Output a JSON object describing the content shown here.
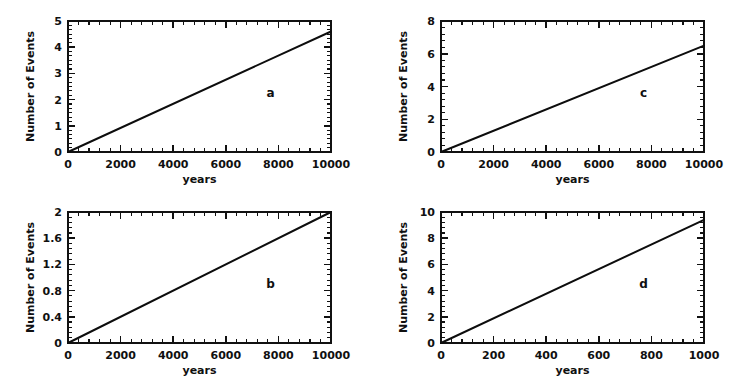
{
  "figure": {
    "background": "#ffffff",
    "ink_color": "#111111",
    "panel_count": 4
  },
  "chart_data": [
    {
      "type": "line",
      "panel_label": "a",
      "title": "",
      "xlabel": "years",
      "ylabel": "Number of Events",
      "x": [
        0,
        10000
      ],
      "values": [
        0,
        4.6
      ],
      "xlim": [
        0,
        10000
      ],
      "ylim": [
        0,
        5
      ],
      "xticks": [
        0,
        2000,
        4000,
        6000,
        8000,
        10000
      ],
      "xtick_labels": [
        "0",
        "2000",
        "4000",
        "6000",
        "8000",
        "10000"
      ],
      "yticks": [
        0,
        1,
        2,
        3,
        4,
        5
      ],
      "ytick_labels": [
        "0",
        "1",
        "2",
        "3",
        "4",
        "5"
      ],
      "x_minor_per_major": 4,
      "y_minor_per_major": 5,
      "grid": false,
      "legend": "none",
      "slope_per_year": 0.00046
    },
    {
      "type": "line",
      "panel_label": "b",
      "title": "",
      "xlabel": "years",
      "ylabel": "Number of Events",
      "x": [
        0,
        10000
      ],
      "values": [
        0,
        2.0
      ],
      "xlim": [
        0,
        10000
      ],
      "ylim": [
        0,
        2
      ],
      "xticks": [
        0,
        2000,
        4000,
        6000,
        8000,
        10000
      ],
      "xtick_labels": [
        "0",
        "2000",
        "4000",
        "6000",
        "8000",
        "10000"
      ],
      "yticks": [
        0,
        0.4,
        0.8,
        1.2,
        1.6,
        2
      ],
      "ytick_labels": [
        "0",
        "0.4",
        "0.8",
        "1.2",
        "1.6",
        "2"
      ],
      "x_minor_per_major": 4,
      "y_minor_per_major": 4,
      "grid": false,
      "legend": "none",
      "slope_per_year": 0.0002
    },
    {
      "type": "line",
      "panel_label": "c",
      "title": "",
      "xlabel": "years",
      "ylabel": "Number of Events",
      "x": [
        0,
        10000
      ],
      "values": [
        0,
        6.5
      ],
      "xlim": [
        0,
        10000
      ],
      "ylim": [
        0,
        8
      ],
      "xticks": [
        0,
        2000,
        4000,
        6000,
        8000,
        10000
      ],
      "xtick_labels": [
        "0",
        "2000",
        "4000",
        "6000",
        "8000",
        "10000"
      ],
      "yticks": [
        0,
        2,
        4,
        6,
        8
      ],
      "ytick_labels": [
        "0",
        "2",
        "4",
        "6",
        "8"
      ],
      "x_minor_per_major": 4,
      "y_minor_per_major": 4,
      "grid": false,
      "legend": "none",
      "slope_per_year": 0.00065
    },
    {
      "type": "line",
      "panel_label": "d",
      "title": "",
      "xlabel": "years",
      "ylabel": "Number of Events",
      "x": [
        0,
        1000
      ],
      "values": [
        0,
        9.4
      ],
      "xlim": [
        0,
        1000
      ],
      "ylim": [
        0,
        10
      ],
      "xticks": [
        0,
        200,
        400,
        600,
        800,
        1000
      ],
      "xtick_labels": [
        "0",
        "200",
        "400",
        "600",
        "800",
        "1000"
      ],
      "yticks": [
        0,
        2,
        4,
        6,
        8,
        10
      ],
      "ytick_labels": [
        "0",
        "2",
        "4",
        "6",
        "8",
        "10"
      ],
      "x_minor_per_major": 4,
      "y_minor_per_major": 4,
      "grid": false,
      "legend": "none",
      "slope_per_year": 0.0094
    }
  ]
}
